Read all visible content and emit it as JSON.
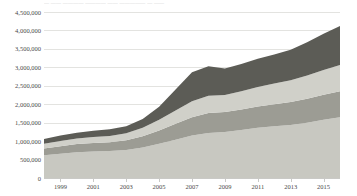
{
  "title_fragment": "—  —— ————  ————  ——  —————  —  ——",
  "axes": {
    "y_tick_labels": [
      "4,500,000",
      "4,000,000",
      "3,500,000",
      "3,000,000",
      "2,500,000",
      "2,000,000",
      "1,500,000",
      "1,000,000",
      "500,000",
      "0"
    ],
    "x_tick_labels": [
      "1999",
      "2001",
      "2003",
      "2005",
      "2007",
      "2009",
      "2011",
      "2013",
      "2015"
    ]
  },
  "colors": {
    "series_1": "#c8c8c1",
    "series_2": "#9c9c94",
    "series_3": "#d0d0c9",
    "series_4": "#5c5c56",
    "gridline": "#e3e3e0",
    "axis": "#c9c9c6",
    "text": "#4a4a4a",
    "background": "#ffffff"
  },
  "chart_data": {
    "type": "area",
    "title": "",
    "xlabel": "",
    "ylabel": "",
    "ylim": [
      0,
      4500000
    ],
    "y_tick_step": 500000,
    "grid": true,
    "legend_position": "none",
    "stacked": true,
    "x": [
      1998,
      1999,
      2000,
      2001,
      2002,
      2003,
      2004,
      2005,
      2006,
      2007,
      2008,
      2009,
      2010,
      2011,
      2012,
      2013,
      2014,
      2015,
      2016
    ],
    "categories": [
      "1998",
      "1999",
      "2000",
      "2001",
      "2002",
      "2003",
      "2004",
      "2005",
      "2006",
      "2007",
      "2008",
      "2009",
      "2010",
      "2011",
      "2012",
      "2013",
      "2014",
      "2015",
      "2016"
    ],
    "series": [
      {
        "name": "Series 1",
        "values": [
          620000,
          660000,
          700000,
          720000,
          730000,
          760000,
          830000,
          930000,
          1040000,
          1150000,
          1220000,
          1250000,
          1300000,
          1360000,
          1400000,
          1440000,
          1500000,
          1580000,
          1650000
        ]
      },
      {
        "name": "Series 2",
        "values": [
          180000,
          200000,
          220000,
          230000,
          240000,
          260000,
          300000,
          360000,
          430000,
          500000,
          540000,
          540000,
          560000,
          580000,
          600000,
          620000,
          650000,
          680000,
          700000
        ]
      },
      {
        "name": "Series 3",
        "values": [
          130000,
          140000,
          150000,
          160000,
          170000,
          190000,
          230000,
          290000,
          360000,
          430000,
          470000,
          460000,
          490000,
          530000,
          560000,
          590000,
          630000,
          670000,
          710000
        ]
      },
      {
        "name": "Series 4",
        "values": [
          130000,
          150000,
          160000,
          170000,
          180000,
          190000,
          240000,
          350000,
          570000,
          790000,
          800000,
          720000,
          740000,
          760000,
          790000,
          830000,
          900000,
          980000,
          1060000
        ]
      }
    ],
    "stack_totals": [
      1060000,
      1150000,
      1230000,
      1280000,
      1320000,
      1400000,
      1600000,
      1930000,
      2400000,
      2870000,
      3030000,
      2970000,
      3090000,
      3230000,
      3350000,
      3480000,
      3680000,
      3910000,
      4120000
    ]
  }
}
